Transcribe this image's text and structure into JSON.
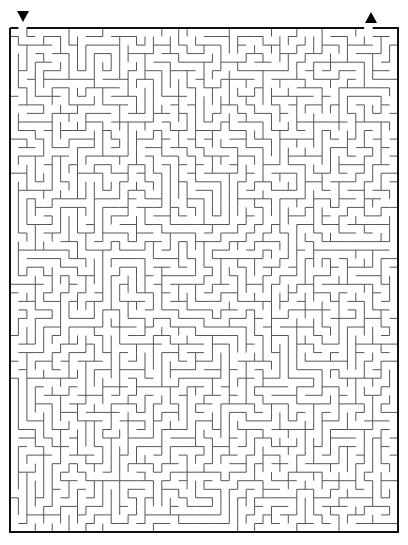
{
  "maze": {
    "left": 10,
    "top": 28,
    "right": 398,
    "bottom": 532,
    "cols": 46,
    "rows": 59,
    "wall_color": "#555555",
    "border_color": "#111111",
    "seed": 20240,
    "entrance_col": 1,
    "exit_col": 42
  },
  "markers": {
    "start": "down-triangle",
    "end": "up-triangle"
  }
}
